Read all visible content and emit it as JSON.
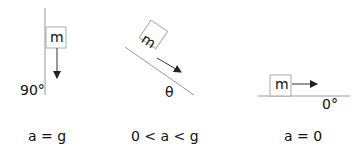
{
  "panels": [
    {
      "mass_label": "m",
      "angle_label": "90°",
      "equation": "a = g"
    },
    {
      "mass_label": "m",
      "angle_label": "θ",
      "equation": "0 < a < g"
    },
    {
      "mass_label": "m",
      "angle_label": "0°",
      "equation": "a = 0"
    }
  ],
  "colors": {
    "line": "#999999",
    "box": "#aaaaaa",
    "arrow": "#222222",
    "text": "#111111"
  }
}
